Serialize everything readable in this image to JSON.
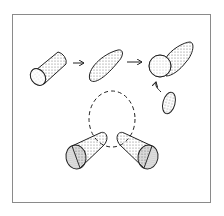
{
  "figure": {
    "description": "Clay modeling steps: roll a cylinder, shape into an elongated oval, attach a ball to form a head, add a small oval; bottom shows two cone shapes joined around a dashed circle",
    "steps": [
      {
        "label": "cylinder"
      },
      {
        "label": "elongated-oval"
      },
      {
        "label": "ball-with-oval"
      },
      {
        "label": "small-oval"
      },
      {
        "label": "two-cones-around-dashed-circle"
      }
    ],
    "colors": {
      "line": "#222222",
      "stipple": "#6a6a6a",
      "frame": "#8a8a8a",
      "background": "#ffffff"
    }
  }
}
